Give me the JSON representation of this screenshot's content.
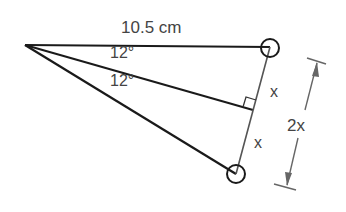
{
  "diagram": {
    "type": "isosceles-triangle-geometry",
    "labels": {
      "top_side_length": "10.5 cm",
      "upper_angle": "12°",
      "lower_angle": "12°",
      "upper_half_segment": "x",
      "lower_half_segment": "x",
      "full_base_dimension": "2x"
    },
    "points": {
      "apex": [
        25,
        45
      ],
      "top_vertex": [
        270,
        47
      ],
      "bottom_vertex": [
        236,
        174
      ],
      "base_midpoint": [
        253,
        110
      ]
    },
    "markers": {
      "top_vertex_circle": true,
      "bottom_vertex_circle": true,
      "right_angle_mark": true
    },
    "colors": {
      "line": "#1a1a1a",
      "base_line": "#555555",
      "dimension_line": "#666666",
      "text": "#444444"
    }
  }
}
